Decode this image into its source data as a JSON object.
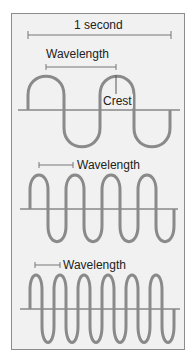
{
  "diagram": {
    "time_span_label": "1 second",
    "panels": [
      {
        "label": "Wavelength",
        "crest_label": "Crest",
        "cycles_per_second": 2
      },
      {
        "label": "Wavelength",
        "cycles_per_second": 4
      },
      {
        "label": "Wavelength",
        "cycles_per_second": 6
      }
    ],
    "colors": {
      "wave": "#8a8a8a",
      "axis": "#555555",
      "background": "#f1f1f1",
      "border": "#8c8c8c"
    }
  }
}
